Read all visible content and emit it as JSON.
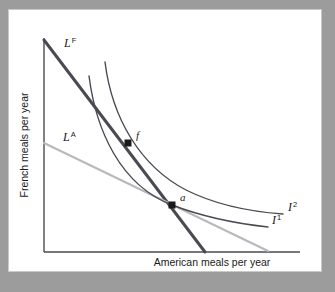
{
  "figure": {
    "name": "budget-lines-and-indifference-curves",
    "background_color": "#9c9c9c",
    "panel_color": "#ffffff"
  },
  "axes": {
    "x_label": "American meals per year",
    "y_label": "French meals per year",
    "axis_color": "#4a4a52",
    "x_axis": {
      "x1": 44,
      "y1": 252,
      "x2": 300,
      "y2": 252
    },
    "y_axis": {
      "x1": 44,
      "y1": 38,
      "x2": 44,
      "y2": 252
    }
  },
  "chart_data": {
    "type": "line",
    "title": "",
    "xlabel": "American meals per year",
    "ylabel": "French meals per year",
    "grid": false,
    "legend": "inline-labels",
    "series": [
      {
        "name": "L^F",
        "label_text": "L",
        "label_sup": "F",
        "role": "budget-line-france",
        "color": "#4a4a52",
        "width": 3.0,
        "points": [
          [
            44,
            40
          ],
          [
            205,
            252
          ]
        ],
        "label_pos": [
          64,
          47
        ]
      },
      {
        "name": "L^A",
        "label_text": "L",
        "label_sup": "A",
        "role": "budget-line-america",
        "color": "#b9b9bd",
        "width": 2.2,
        "points": [
          [
            44,
            143
          ],
          [
            268,
            251
          ]
        ],
        "label_pos": [
          63,
          141
        ]
      },
      {
        "name": "I1",
        "label_text": "I",
        "label_sup": "1",
        "role": "indifference-curve-low",
        "color": "#4a4a52",
        "width": 1.4,
        "path": "M 89,76 C 96,130 120,185 172,205 C 206,218 240,224 268,227",
        "label_pos": [
          272,
          224
        ]
      },
      {
        "name": "I2",
        "label_text": "I",
        "label_sup": "2",
        "role": "indifference-curve-high",
        "color": "#4a4a52",
        "width": 1.4,
        "path": "M 105,62 C 112,118 140,166 186,190 C 218,206 255,212 283,214",
        "label_pos": [
          288,
          211
        ]
      }
    ],
    "points": [
      {
        "name": "f",
        "label": "f",
        "x": 128,
        "y": 143,
        "label_pos": [
          136,
          139
        ],
        "marker": "square",
        "color": "#1a1a1a",
        "size": 7
      },
      {
        "name": "a",
        "label": "a",
        "x": 172,
        "y": 205,
        "label_pos": [
          180,
          201
        ],
        "marker": "square",
        "color": "#1a1a1a",
        "size": 7
      }
    ]
  }
}
